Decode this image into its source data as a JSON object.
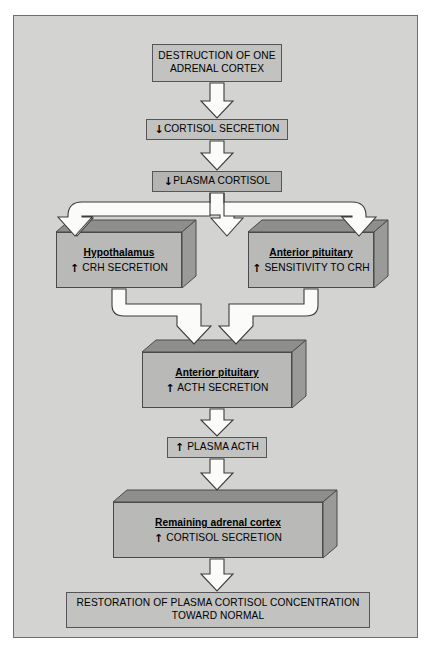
{
  "figure": {
    "panel_color": "#d3d3d1",
    "box_color": "#c2c2c0",
    "block_face_color": "#b9b9b7",
    "block_top_color": "#8e8e8c",
    "block_side_color": "#9a9a98",
    "outline_color": "#4a4a4c",
    "arrow_fill": "#fbfbf9",
    "arrow_stroke": "#3c3c3e"
  },
  "glyphs": {
    "down": "↓",
    "up": "↑"
  },
  "nodes": {
    "destruction": {
      "line1": "DESTRUCTION OF ONE",
      "line2": "ADRENAL CORTEX"
    },
    "cortisol_secretion_down": {
      "arrow": "↓",
      "text": "CORTISOL SECRETION"
    },
    "plasma_cortisol_down": {
      "arrow": "↓",
      "text": "PLASMA CORTISOL"
    },
    "hypothalamus": {
      "title": "Hypothalamus",
      "arrow": "↑",
      "text": "CRH SECRETION"
    },
    "anterior_pituitary_sensitivity": {
      "title": "Anterior pituitary",
      "arrow": "↑",
      "text": "SENSITIVITY TO CRH"
    },
    "anterior_pituitary_acth": {
      "title": "Anterior pituitary",
      "arrow": "↑",
      "text": "ACTH SECRETION"
    },
    "plasma_acth_up": {
      "arrow": "↑",
      "text": "PLASMA ACTH"
    },
    "remaining_adrenal_cortex": {
      "title": "Remaining adrenal cortex",
      "arrow": "↑",
      "text": "CORTISOL SECRETION"
    },
    "restoration": {
      "line1": "RESTORATION OF PLASMA CORTISOL CONCENTRATION",
      "line2": "TOWARD NORMAL"
    }
  },
  "connectors": [
    {
      "name": "destruction-to-cortisol-secretion",
      "kind": "straight-down-arrow"
    },
    {
      "name": "cortisol-secretion-to-plasma-cortisol",
      "kind": "straight-down-arrow"
    },
    {
      "name": "plasma-cortisol-split-to-hypothalamus-and-pituitary",
      "kind": "split-branch-arrow"
    },
    {
      "name": "hypothalamus-to-anterior-pituitary-acth",
      "kind": "elbow-arrow"
    },
    {
      "name": "pituitary-sensitivity-to-anterior-pituitary-acth",
      "kind": "elbow-arrow"
    },
    {
      "name": "anterior-pituitary-acth-to-plasma-acth",
      "kind": "straight-down-arrow"
    },
    {
      "name": "plasma-acth-to-remaining-adrenal-cortex",
      "kind": "straight-down-arrow"
    },
    {
      "name": "remaining-adrenal-cortex-to-restoration",
      "kind": "straight-down-arrow"
    }
  ]
}
